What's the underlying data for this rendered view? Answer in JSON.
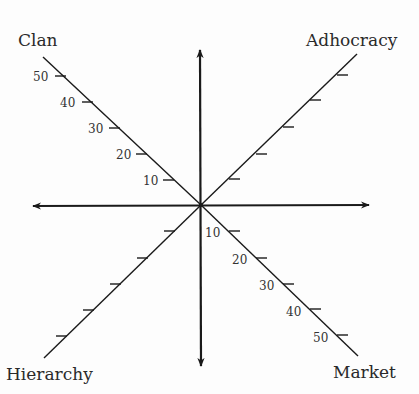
{
  "diagram": {
    "quadrants": {
      "top_left": "Clan",
      "top_right": "Adhocracy",
      "bottom_left": "Hierarchy",
      "bottom_right": "Market"
    },
    "clan_scale": [
      "10",
      "20",
      "30",
      "40",
      "50"
    ],
    "market_scale": [
      "10",
      "20",
      "30",
      "40",
      "50"
    ],
    "colors": {
      "line": "#1a1a1a",
      "text": "#2a2a2a",
      "background": "#fdfdfd"
    }
  }
}
